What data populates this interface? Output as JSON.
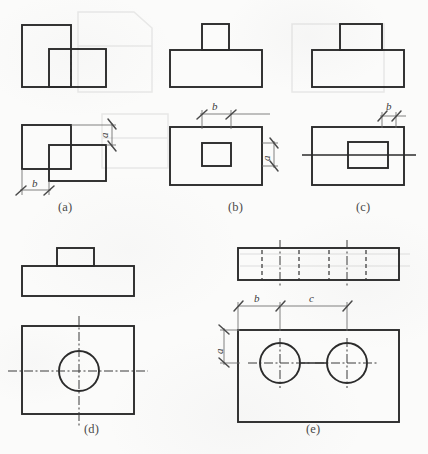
{
  "figure": {
    "background_color": "#fbfbfa",
    "line_color": "#2b2b2b",
    "dimension_color": "#6a6a6a",
    "panels": [
      {
        "id": "a",
        "caption": "(a)",
        "description": "L-shaped block: front view two overlapping rectangles with hidden line; top view two offset rectangles",
        "dimensions": [
          {
            "label": "a",
            "orientation": "vertical",
            "position": "right"
          },
          {
            "label": "b",
            "orientation": "horizontal",
            "position": "bottom-left"
          }
        ]
      },
      {
        "id": "b",
        "caption": "(b)",
        "description": "Base plate with narrow central boss; top view shows rectangular boss outline inside plate",
        "dimensions": [
          {
            "label": "b",
            "orientation": "horizontal",
            "position": "top"
          },
          {
            "label": "a",
            "orientation": "vertical",
            "position": "right"
          }
        ]
      },
      {
        "id": "c",
        "caption": "(c)",
        "description": "Base plate with wide central boss; top view shows rectangular boss with horizontal centre line",
        "dimensions": [
          {
            "label": "b",
            "orientation": "horizontal",
            "position": "top-right"
          }
        ]
      },
      {
        "id": "d",
        "caption": "(d)",
        "description": "Base plate with small boss; top view shows plate with one circular hole and crossed centre lines",
        "dimensions": []
      },
      {
        "id": "e",
        "caption": "(e)",
        "description": "Flat plate with two through holes; front view shows hidden lines for both holes, top view shows two circles",
        "dimensions": [
          {
            "label": "a",
            "orientation": "vertical",
            "position": "left"
          },
          {
            "label": "b",
            "orientation": "horizontal",
            "position": "top-left"
          },
          {
            "label": "c",
            "orientation": "horizontal",
            "position": "top-right"
          }
        ]
      }
    ]
  },
  "labels": {
    "cap_a": "(a)",
    "cap_b": "(b)",
    "cap_c": "(c)",
    "cap_d": "(d)",
    "cap_e": "(e)",
    "dim_a1": "a",
    "dim_b1": "b",
    "dim_b2": "b",
    "dim_a2": "a",
    "dim_b3": "b",
    "dim_a3": "a",
    "dim_b4": "b",
    "dim_c4": "c"
  }
}
